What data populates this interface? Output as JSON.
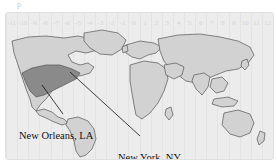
{
  "figure": {
    "artifact_text": "p",
    "map_background_color": "#ececec",
    "land_color": "#d2d2d2",
    "land_outline_color": "#555555",
    "highlight_color": "#8a8a8a",
    "gridline_color": "#e3e3e3",
    "tz_label_color": "#d5d5d5",
    "annotation_color": "#111111"
  },
  "timezone_axis": {
    "name": "timezone-offsets",
    "labels": [
      "-11",
      "-10",
      "-9",
      "-8",
      "-7",
      "-6",
      "-5",
      "-4",
      "-3",
      "-2",
      "-1",
      "0",
      "1",
      "2",
      "3",
      "4",
      "5",
      "6",
      "7",
      "8",
      "9",
      "10",
      "11",
      "12"
    ]
  },
  "annotations": [
    {
      "id": "new-orleans",
      "label": "New Orleans, LA"
    },
    {
      "id": "new-york",
      "label": "New York, NY"
    }
  ],
  "regions": {
    "highlighted": "continental-united-states"
  }
}
